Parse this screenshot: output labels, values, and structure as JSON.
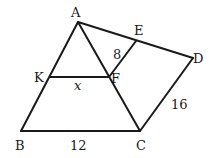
{
  "diagram": {
    "points": {
      "A": {
        "label": "A",
        "x": 78,
        "y": 22
      },
      "E": {
        "label": "E",
        "x": 136,
        "y": 41
      },
      "D": {
        "label": "D",
        "x": 193,
        "y": 58
      },
      "K": {
        "label": "K",
        "x": 50,
        "y": 77
      },
      "F": {
        "label": "F",
        "x": 109,
        "y": 77
      },
      "B": {
        "label": "B",
        "x": 21,
        "y": 131
      },
      "C": {
        "label": "C",
        "x": 140,
        "y": 131
      }
    },
    "segments": [
      "AB",
      "AC",
      "BC",
      "AD",
      "DC",
      "KF",
      "EF"
    ],
    "measures": {
      "EF": "8",
      "KF": "x",
      "BC": "12",
      "DC": "16"
    }
  }
}
